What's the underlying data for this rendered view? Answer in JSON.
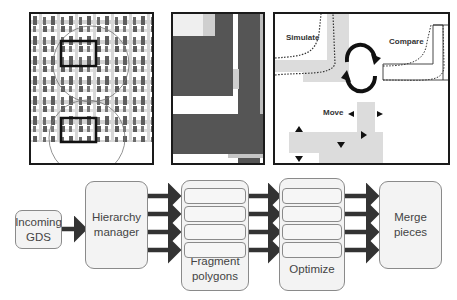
{
  "panels": {
    "layout": {
      "label": "layout-overview"
    },
    "zoom": {
      "label": "zoomed-polygon"
    },
    "loop": {
      "simulate_label": "Simulate",
      "compare_label": "Compare",
      "move_label": "Move"
    }
  },
  "flow": {
    "incoming": {
      "line1": "Incoming",
      "line2": "GDS"
    },
    "hierarchy": {
      "line1": "Hierarchy",
      "line2": "manager"
    },
    "fragment": {
      "line1": "Fragment",
      "line2": "polygons"
    },
    "optimize": {
      "line1": "Optimize"
    },
    "merge": {
      "line1": "Merge",
      "line2": "pieces"
    }
  },
  "colors": {
    "frame": "#1a1a1a",
    "arrow": "#333333",
    "box_fill": "#f3f3f3",
    "box_border": "#8a8a8a",
    "layout_gray": "#666666",
    "light_gray": "#d9d9d9"
  }
}
